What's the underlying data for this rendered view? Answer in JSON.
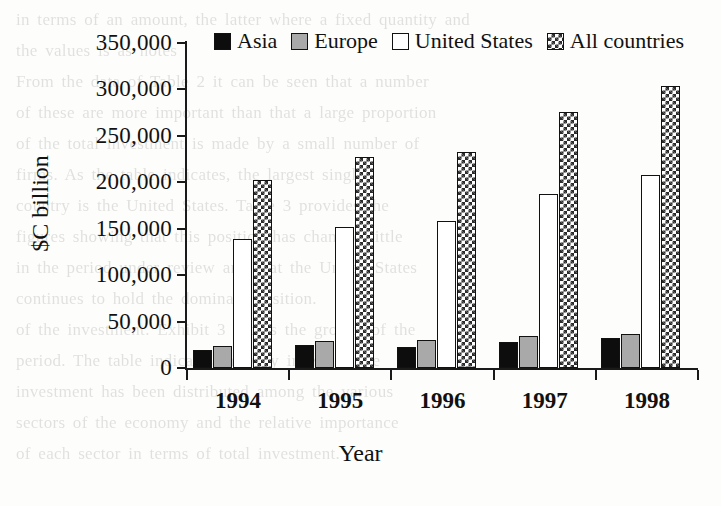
{
  "chart_data": {
    "type": "bar",
    "title": "",
    "xlabel": "Year",
    "ylabel": "$C billion",
    "categories": [
      "1994",
      "1995",
      "1996",
      "1997",
      "1998"
    ],
    "series": [
      {
        "name": "Asia",
        "pattern": "solid-black",
        "values": [
          19000,
          25000,
          23000,
          28000,
          32000
        ]
      },
      {
        "name": "Europe",
        "pattern": "solid-gray",
        "values": [
          24000,
          29000,
          30000,
          34000,
          37000
        ]
      },
      {
        "name": "United States",
        "pattern": "open-white",
        "values": [
          139000,
          152000,
          158000,
          187000,
          208000
        ]
      },
      {
        "name": "All countries",
        "pattern": "checkered",
        "values": [
          203000,
          227000,
          233000,
          276000,
          304000
        ]
      }
    ],
    "ylim": [
      0,
      350000
    ],
    "ytick_values": [
      0,
      50000,
      100000,
      150000,
      200000,
      250000,
      300000,
      350000
    ],
    "ytick_labels": [
      "0",
      "50,000",
      "100,000",
      "150,000",
      "200,000",
      "250,000",
      "300,000",
      "350,000"
    ],
    "grid": false,
    "legend_position": "top",
    "legend": [
      "Asia",
      "Europe",
      "United States",
      "All countries"
    ],
    "colors": {
      "axis": "#1a1a1a",
      "asia": "#0d0d0d",
      "europe": "#a9a9a9",
      "united_states": "#ffffff",
      "all_countries": "#2b2b2b",
      "background": "#fdfdfb"
    }
  },
  "background_text": {
    "lines": [
      "in terms of an amount, the latter where a fixed quantity and",
      "the values is as notes",
      "From the data of Table 2 it can be seen that a number",
      "of these are more important than that a large proportion",
      "of the total investment is made by a small number of",
      "firms. As the table indicates, the largest single",
      "country is the United States. Table 3 provides the",
      "figures showing that this position has changed little",
      "in the period under review and that the United States",
      "continues to hold the dominant position.",
      "of the investment. Exhibit 3 shows the growth of the",
      "period. The table indicates the way in which the",
      "investment has been distributed among the various",
      "sectors of the economy and the relative importance",
      "of each sector in terms of total investment."
    ]
  }
}
